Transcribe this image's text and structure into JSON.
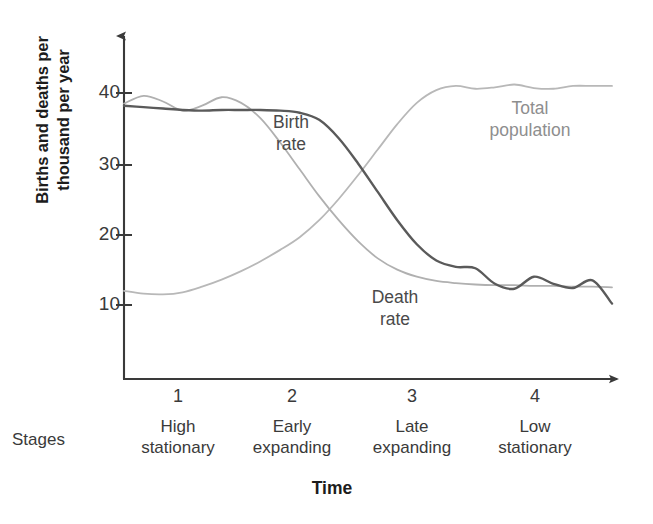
{
  "chart_data": {
    "type": "line",
    "xlabel": "Time",
    "ylabel_line1": "Births and deaths per",
    "ylabel_line2": "thousand per year",
    "ylim": [
      0,
      45
    ],
    "yticks": [
      10,
      20,
      30,
      40
    ],
    "ytick_labels": [
      "10",
      "20",
      "30",
      "40"
    ],
    "grid": false,
    "legend_position": "inline-annotations",
    "x": [
      0,
      4,
      8,
      12,
      16,
      20,
      24,
      28,
      32,
      36,
      40,
      44,
      48,
      52,
      56,
      60,
      64,
      68,
      72,
      76,
      80,
      84,
      88,
      92,
      96,
      100
    ],
    "series": [
      {
        "name": "Birth rate",
        "color": "#5a5a5a",
        "values": [
          38.2,
          38.0,
          37.8,
          37.6,
          37.5,
          37.6,
          37.6,
          37.6,
          37.5,
          37.2,
          36.2,
          33.6,
          30.0,
          26.0,
          22.0,
          18.6,
          16.3,
          15.4,
          15.2,
          13.0,
          12.3,
          14.0,
          13.0,
          12.4,
          13.5,
          10.2
        ]
      },
      {
        "name": "Death rate",
        "color": "#b0b0b0",
        "values": [
          38.5,
          39.6,
          38.8,
          37.5,
          38.2,
          39.4,
          38.6,
          36.4,
          33.0,
          29.2,
          25.4,
          22.0,
          19.0,
          16.6,
          15.0,
          14.0,
          13.4,
          13.1,
          12.9,
          12.8,
          12.8,
          12.7,
          12.7,
          12.6,
          12.6,
          12.5
        ]
      },
      {
        "name": "Total population",
        "color": "#b8b8b8",
        "values": [
          12.0,
          11.6,
          11.5,
          11.8,
          12.6,
          13.6,
          14.8,
          16.2,
          17.8,
          19.6,
          22.0,
          25.0,
          28.4,
          32.0,
          35.6,
          38.6,
          40.4,
          41.0,
          40.6,
          40.8,
          41.2,
          40.7,
          40.6,
          41.0,
          41.0,
          41.0
        ]
      }
    ],
    "annotations": [
      {
        "name": "birth-rate-label",
        "line1": "Birth",
        "line2": "rate"
      },
      {
        "name": "death-rate-label",
        "line1": "Death",
        "line2": "rate"
      },
      {
        "name": "total-population-label",
        "line1": "Total",
        "line2": "population"
      }
    ],
    "stages_caption": "Stages",
    "stages": [
      {
        "number": "1",
        "name_line1": "High",
        "name_line2": "stationary"
      },
      {
        "number": "2",
        "name_line1": "Early",
        "name_line2": "expanding"
      },
      {
        "number": "3",
        "name_line1": "Late",
        "name_line2": "expanding"
      },
      {
        "number": "4",
        "name_line1": "Low",
        "name_line2": "stationary"
      }
    ],
    "axis_color": "#3a3a3a"
  }
}
